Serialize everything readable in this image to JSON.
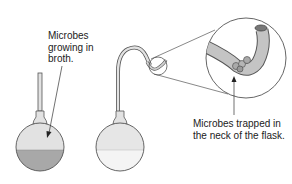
{
  "diagram": {
    "left_label": {
      "line1": "Microbes",
      "line2": "growing in",
      "line3": "broth."
    },
    "right_label": {
      "line1": "Microbes trapped in",
      "line2": "the neck of the flask."
    },
    "colors": {
      "cloudy_broth": "#a8a8a8",
      "clear_broth": "#ececec",
      "glass": "#e2e2e2",
      "outline": "#555555",
      "tube": "#c4c4c4"
    }
  }
}
